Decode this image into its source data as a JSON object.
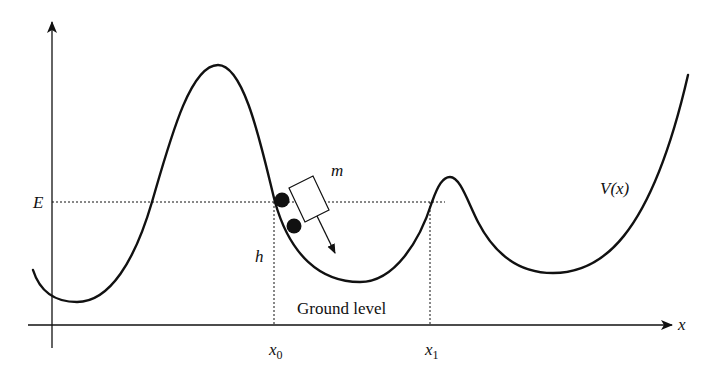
{
  "diagram": {
    "type": "potential-energy-curve",
    "axes": {
      "x_label": "x",
      "y_label": ""
    },
    "curve_label": "V(x)",
    "energy_label": "E",
    "height_label": "h",
    "mass_label": "m",
    "ground_label": "Ground level",
    "points": [
      {
        "name": "x0",
        "base": "x",
        "sub": "0"
      },
      {
        "name": "x1",
        "base": "x",
        "sub": "1"
      }
    ],
    "colors": {
      "stroke": "#111111",
      "background": "#ffffff"
    }
  }
}
